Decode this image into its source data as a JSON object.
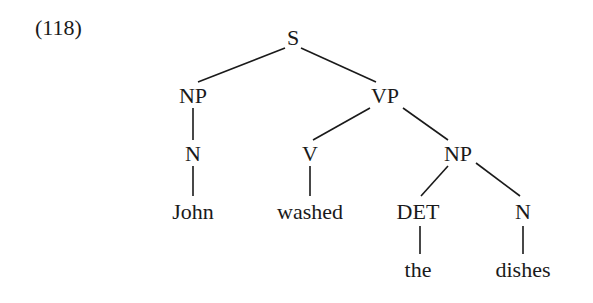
{
  "example_number": "(118)",
  "tree": {
    "nodes": {
      "S": {
        "label": "S",
        "x": 293,
        "y": 38
      },
      "NP1": {
        "label": "NP",
        "x": 193,
        "y": 96
      },
      "VP": {
        "label": "VP",
        "x": 385,
        "y": 96
      },
      "N1": {
        "label": "N",
        "x": 193,
        "y": 154
      },
      "V": {
        "label": "V",
        "x": 310,
        "y": 154
      },
      "NP2": {
        "label": "NP",
        "x": 458,
        "y": 154
      },
      "John": {
        "label": "John",
        "x": 193,
        "y": 212
      },
      "washed": {
        "label": "washed",
        "x": 310,
        "y": 212
      },
      "DET": {
        "label": "DET",
        "x": 418,
        "y": 212
      },
      "N2": {
        "label": "N",
        "x": 523,
        "y": 212
      },
      "the": {
        "label": "the",
        "x": 418,
        "y": 270
      },
      "dishes": {
        "label": "dishes",
        "x": 523,
        "y": 270
      }
    },
    "edges": [
      [
        "S",
        "NP1"
      ],
      [
        "S",
        "VP"
      ],
      [
        "NP1",
        "N1"
      ],
      [
        "N1",
        "John"
      ],
      [
        "VP",
        "V"
      ],
      [
        "VP",
        "NP2"
      ],
      [
        "V",
        "washed"
      ],
      [
        "NP2",
        "DET"
      ],
      [
        "NP2",
        "N2"
      ],
      [
        "DET",
        "the"
      ],
      [
        "N2",
        "dishes"
      ]
    ]
  }
}
